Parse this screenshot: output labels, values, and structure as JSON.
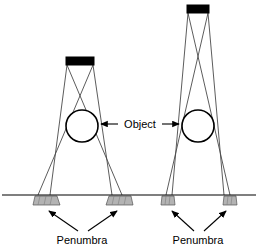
{
  "diagram": {
    "type": "optics-ray-diagram",
    "background_color": "#ffffff",
    "line_color": "#000000",
    "ray_color": "#444444",
    "penumbra_fill": "#b3b3b3",
    "source_fill": "#000000",
    "labels": {
      "object": "Object",
      "penumbra_left": "Penumbra",
      "penumbra_right": "Penumbra"
    },
    "ground": {
      "label": "ground-line",
      "y": 195,
      "x_start": 2,
      "x_end": 256
    },
    "setups": [
      {
        "name": "left-setup",
        "source": {
          "name": "wide-source",
          "x": 66,
          "y": 57,
          "width": 28,
          "height": 8,
          "color": "#000000"
        },
        "object": {
          "name": "left-circle",
          "cx": 82,
          "cy": 126,
          "r": 16
        },
        "penumbra_bars": [
          {
            "name": "left-penumbra-outer",
            "x": 33,
            "y": 196,
            "width": 24,
            "height": 9
          },
          {
            "name": "left-penumbra-inner",
            "x": 107,
            "y": 196,
            "width": 24,
            "height": 9
          }
        ],
        "label": "Penumbra",
        "label_x": 82,
        "label_y": 243
      },
      {
        "name": "right-setup",
        "source": {
          "name": "narrow-source",
          "x": 187,
          "y": 5,
          "width": 22,
          "height": 8,
          "color": "#000000"
        },
        "object": {
          "name": "right-circle",
          "cx": 198,
          "cy": 126,
          "r": 16
        },
        "penumbra_bars": [
          {
            "name": "right-penumbra-outer",
            "x": 161,
            "y": 196,
            "width": 13,
            "height": 9
          },
          {
            "name": "right-penumbra-inner",
            "x": 223,
            "y": 196,
            "width": 13,
            "height": 9
          }
        ],
        "label": "Penumbra",
        "label_x": 198,
        "label_y": 243
      }
    ],
    "object_label": {
      "text": "Object",
      "x": 140,
      "y": 127,
      "arrow_left_to": 103,
      "arrow_right_to": 178
    }
  }
}
